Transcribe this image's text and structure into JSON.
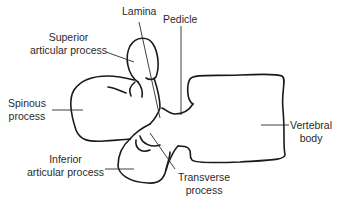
{
  "diagram": {
    "line_color": "#1a1a1a",
    "text_color": "#2a2a2a",
    "labels": {
      "lamina": {
        "line1": "Lamina"
      },
      "pedicle": {
        "line1": "Pedicle"
      },
      "superior_articular_process": {
        "line1": "Superior",
        "line2": "articular process"
      },
      "spinous_process": {
        "line1": "Spinous",
        "line2": "process"
      },
      "vertebral_body": {
        "line1": "Vertebral",
        "line2": "body"
      },
      "inferior_articular_process": {
        "line1": "Inferior",
        "line2": "articular process"
      },
      "transverse_process": {
        "line1": "Transverse",
        "line2": "process"
      }
    }
  }
}
